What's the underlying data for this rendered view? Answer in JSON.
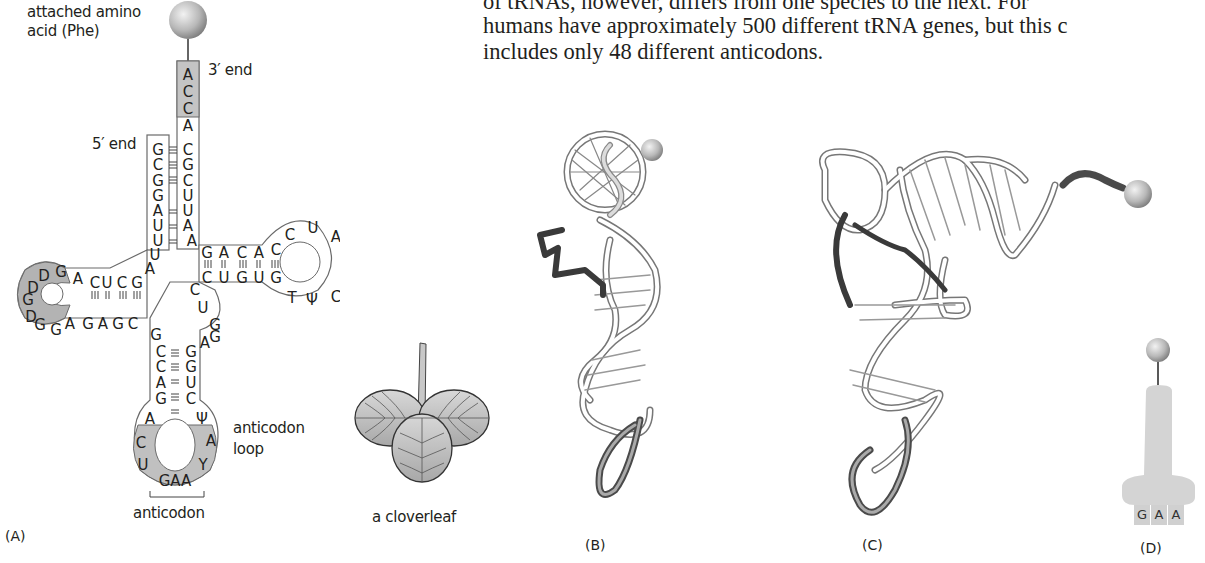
{
  "text_block": {
    "line1": "of tRNAs, however, differs from one species to the next. For",
    "line2": "humans have approximately 500 different tRNA genes, but this c",
    "line3": "includes only 48 different anticodons."
  },
  "panel_a": {
    "panel_label": "(A)",
    "amino_acid_label_1": "attached amino",
    "amino_acid_label_2": "acid (Phe)",
    "three_prime_label": "3′ end",
    "five_prime_label": "5′ end",
    "anticodon_loop_label_1": "anticodon",
    "anticodon_loop_label_2": "loop",
    "anticodon_label": "anticodon",
    "acceptor_3prime": [
      "A",
      "C",
      "C",
      "A",
      "C",
      "G",
      "C",
      "U",
      "U",
      "A",
      "A"
    ],
    "acceptor_5prime": [
      "G",
      "C",
      "G",
      "G",
      "A",
      "U",
      "U",
      "U",
      "A"
    ],
    "d_arm_top": [
      "C",
      "U",
      "C",
      "G"
    ],
    "d_loop": [
      "A",
      "G",
      "D",
      "D",
      "D",
      "G",
      "G",
      "G",
      "A"
    ],
    "d_arm_bottom": [
      "G",
      "A",
      "G",
      "C"
    ],
    "t_arm_top": [
      "G",
      "A",
      "C",
      "A",
      "C"
    ],
    "t_loop": [
      "C",
      "U",
      "A",
      "G",
      "C",
      "Ψ",
      "T"
    ],
    "t_arm_bottom": [
      "C",
      "U",
      "G",
      "U",
      "G"
    ],
    "variable_loop": [
      "C",
      "U",
      "G",
      "A",
      "G"
    ],
    "anticodon_stem_left": [
      "G",
      "C",
      "C",
      "A",
      "G"
    ],
    "anticodon_stem_right": [
      "G",
      "G",
      "U",
      "C"
    ],
    "anticodon_loop": [
      "A",
      "C",
      "U",
      "G",
      "A",
      "A",
      "Y",
      "A",
      "Ψ"
    ],
    "anticodon": "GAA"
  },
  "cloverleaf": {
    "label": "a cloverleaf"
  },
  "panel_b": {
    "panel_label": "(B)"
  },
  "panel_c": {
    "panel_label": "(C)"
  },
  "panel_d": {
    "panel_label": "(D)",
    "anticodon_letters": [
      "G",
      "A",
      "A"
    ]
  },
  "colors": {
    "gray_region": "#b3b3b3",
    "light_gray_region": "#c8c8c8",
    "symbol_fill": "#d4d4d4",
    "dark_strand": "#4a4a4a",
    "outline": "#555555"
  }
}
